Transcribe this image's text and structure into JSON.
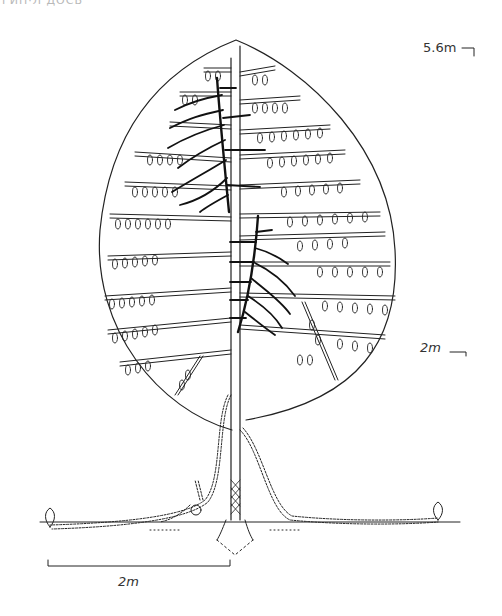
{
  "figure": {
    "header_fragment": "ГИН·Л  ДОСЬ",
    "labels": {
      "height_top": "5.6m",
      "height_mid": "2m",
      "horizontal_scale": "2m"
    },
    "colors": {
      "ink": "#222222",
      "background": "#ffffff"
    }
  }
}
